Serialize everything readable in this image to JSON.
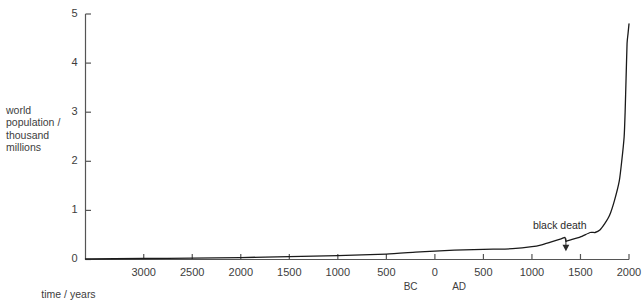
{
  "chart_data": {
    "type": "line",
    "title": "",
    "xlabel": "time / years",
    "ylabel": "world population / thousand millions",
    "ylabel_lines": [
      "world",
      "population /",
      "thousand",
      "millions"
    ],
    "xlim": [
      -3600,
      2000
    ],
    "ylim": [
      0,
      5
    ],
    "grid": false,
    "legend": null,
    "y_ticks": [
      "0",
      "1",
      "2",
      "3",
      "4",
      "5"
    ],
    "y_tick_values": [
      0,
      1,
      2,
      3,
      4,
      5
    ],
    "x_ticks": [
      "3000",
      "2500",
      "2000",
      "1500",
      "1000",
      "500",
      "0",
      "500",
      "1000",
      "1500",
      "2000"
    ],
    "x_tick_values": [
      -3000,
      -2500,
      -2000,
      -1500,
      -1000,
      -500,
      0,
      500,
      1000,
      1500,
      2000
    ],
    "era_labels": [
      {
        "text": "BC",
        "x": -250
      },
      {
        "text": "AD",
        "x": 250
      }
    ],
    "annotations": [
      {
        "text": "black death",
        "x": 1350,
        "y": 0.45,
        "arrow": true,
        "arrow_to_y": 0.37
      }
    ],
    "series": [
      {
        "name": "world population",
        "x": [
          -3600,
          -3000,
          -2500,
          -2000,
          -1500,
          -1000,
          -500,
          -200,
          0,
          200,
          400,
          600,
          800,
          1000,
          1100,
          1200,
          1300,
          1340,
          1350,
          1360,
          1400,
          1500,
          1600,
          1650,
          1700,
          1750,
          1800,
          1850,
          1900,
          1925,
          1950,
          1960,
          1970,
          1980,
          1990,
          2000
        ],
        "y": [
          0.01,
          0.02,
          0.03,
          0.04,
          0.06,
          0.08,
          0.11,
          0.15,
          0.17,
          0.19,
          0.2,
          0.21,
          0.22,
          0.26,
          0.3,
          0.36,
          0.42,
          0.45,
          0.37,
          0.38,
          0.4,
          0.46,
          0.55,
          0.55,
          0.6,
          0.73,
          0.9,
          1.2,
          1.6,
          2.0,
          2.5,
          3.0,
          3.7,
          4.4,
          4.6,
          4.8
        ]
      }
    ]
  },
  "axis": {
    "line_color": "#555555",
    "curve_color": "#1a1a1a"
  }
}
